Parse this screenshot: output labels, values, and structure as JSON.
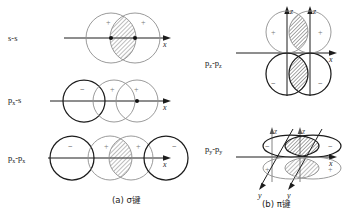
{
  "figure": {
    "background_color": "#ffffff",
    "ink_dark": "#1c1c1c",
    "ink_light": "#8e8e8e",
    "hatch_color": "#666666"
  },
  "captions": [
    {
      "id": "caption-a",
      "text": "(a) σ键"
    },
    {
      "id": "caption-b",
      "text": "(b) π键"
    }
  ],
  "panel_a": {
    "name": "sigma-bond-panel",
    "rows": [
      {
        "id": "row-s-s",
        "label": "s-s",
        "label_base": "s-s",
        "label_sub": "",
        "axis_label": "x",
        "signs": [
          "+",
          "+"
        ],
        "overlap": "hatched",
        "nuclei": 2
      },
      {
        "id": "row-px-s",
        "label": "px-s",
        "label_base": "p",
        "label_sub": "x",
        "label_tail": "-s",
        "axis_label": "x",
        "signs": [
          "−",
          "+",
          "+"
        ],
        "overlap": "none",
        "nuclei": 1
      },
      {
        "id": "row-px-px",
        "label": "px-px",
        "label_base": "p",
        "label_sub": "x",
        "label_tail": "-p",
        "label_sub2": "x",
        "axis_label": "x",
        "signs": [
          "−",
          "+",
          "+",
          "−"
        ],
        "overlap": "hatched",
        "nuclei": 0
      }
    ]
  },
  "panel_b": {
    "name": "pi-bond-panel",
    "rows": [
      {
        "id": "row-pz-pz",
        "label_base": "p",
        "label_sub": "z",
        "label_tail": "-p",
        "label_sub2": "z",
        "axis_labels": [
          "z",
          "z",
          "x"
        ],
        "signs_top": [
          "+",
          "+"
        ],
        "signs_bottom": [
          "−",
          "−"
        ],
        "overlap": "hatched-two"
      },
      {
        "id": "row-py-py",
        "label_base": "p",
        "label_sub": "y",
        "label_tail": "-p",
        "label_sub2": "y",
        "axis_labels": [
          "z",
          "z",
          "x",
          "y",
          "y"
        ],
        "signs_top": [
          "−",
          "−"
        ],
        "signs_bottom": [
          "+",
          "+"
        ],
        "overlap": "hatched-two"
      }
    ]
  }
}
